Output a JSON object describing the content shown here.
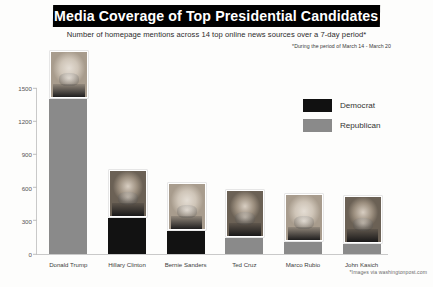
{
  "header": {
    "title": "Media Coverage of Top Presidential Candidates",
    "subtitle": "Number of homepage mentions across 14 top online news sources over a 7-day period*",
    "subnote": "*During the period of March 14 - March 20"
  },
  "legend": {
    "items": [
      {
        "label": "Democrat",
        "color": "#111111"
      },
      {
        "label": "Republican",
        "color": "#8a8a8a"
      }
    ]
  },
  "credit": "*Images via washingtonpost.com",
  "chart_data": {
    "type": "bar",
    "title": "Media Coverage of Top Presidential Candidates",
    "subtitle": "Number of homepage mentions across 14 top online news sources over a 7-day period*",
    "xlabel": "",
    "ylabel": "",
    "ylim": [
      0,
      1500
    ],
    "yticks": [
      0,
      300,
      600,
      900,
      1200,
      1500
    ],
    "ytick_labels": [
      "0",
      "300",
      "600",
      "900",
      "1200",
      "1500"
    ],
    "grid": false,
    "legend_position": "upper right",
    "categories": [
      "Donald Trump",
      "Hillary Clinton",
      "Bernie Sanders",
      "Ted Cruz",
      "Marco Rubio",
      "John Kasich"
    ],
    "values": [
      1400,
      325,
      208,
      145,
      108,
      90
    ],
    "party": [
      "Republican",
      "Democrat",
      "Democrat",
      "Republican",
      "Republican",
      "Republican"
    ],
    "colors": [
      "#8a8a8a",
      "#121212",
      "#121212",
      "#8a8a8a",
      "#8a8a8a",
      "#8a8a8a"
    ]
  }
}
